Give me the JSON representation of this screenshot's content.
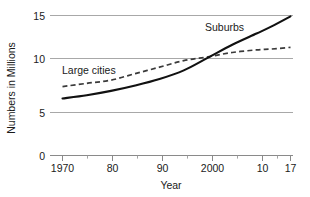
{
  "chart_data": {
    "type": "line",
    "title": "",
    "xlabel": "Year",
    "ylabel": "Numbers in Millions",
    "xlim": [
      1970,
      2017
    ],
    "ylim": [
      0,
      15
    ],
    "grid": true,
    "legend": "inline-labels",
    "y_ticks": [
      "0",
      "5",
      "10",
      "15"
    ],
    "y_tick_values": [
      0,
      5,
      10,
      15
    ],
    "x_ticks": [
      "1970",
      "80",
      "90",
      "2000",
      "10",
      "17"
    ],
    "x_tick_values": [
      1970,
      1980,
      1990,
      2000,
      2010,
      2017
    ],
    "x_minor_tick_values": [
      1975,
      1985,
      1995,
      2005,
      2013
    ],
    "x": [
      1970,
      1975,
      1980,
      1985,
      1990,
      1995,
      2000,
      2005,
      2010,
      2013,
      2017
    ],
    "series": [
      {
        "name": "Suburbs",
        "style": "solid",
        "color": "#111111",
        "label_x": 2003,
        "label_y": 13.2,
        "values": [
          6.3,
          6.6,
          7.0,
          7.5,
          8.1,
          8.9,
          10.1,
          11.6,
          12.9,
          13.7,
          14.9
        ]
      },
      {
        "name": "Large cities",
        "style": "dashed",
        "color": "#3a3a3a",
        "label_x": 1977,
        "label_y": 10.6,
        "values": [
          7.4,
          7.7,
          8.0,
          8.6,
          9.2,
          9.8,
          10.2,
          10.7,
          11.0,
          11.1,
          11.3
        ]
      }
    ],
    "annotations": [
      {
        "text": "Suburbs",
        "series": "Suburbs"
      },
      {
        "text": "Large cities",
        "series": "Large cities"
      }
    ],
    "crossover": {
      "x": 2000,
      "y": 10.2
    }
  }
}
